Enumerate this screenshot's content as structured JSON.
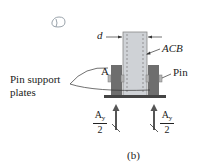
{
  "figure": {
    "labels": {
      "d": "d",
      "acb": "ACB",
      "a": "A",
      "pin": "Pin",
      "pin_support_line1": "Pin support",
      "pin_support_line2": "plates",
      "caption": "(b)"
    },
    "force_left": {
      "num": "A",
      "num_sub": "y",
      "den": "2"
    },
    "force_right": {
      "num": "A",
      "num_sub": "y",
      "den": "2"
    },
    "colors": {
      "member_fill": "#cfd2d6",
      "plate_fill": "#6e6e6e",
      "base_fill": "#444444",
      "arrow": "#555555",
      "logo_stroke": "#9aa3ab"
    }
  }
}
